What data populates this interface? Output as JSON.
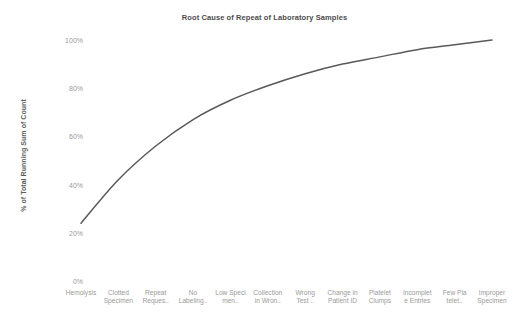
{
  "chart_data": {
    "type": "line",
    "title": "Root Cause of Repeat of Laboratory Samples",
    "xlabel": "",
    "ylabel": "% of Total Running Sum of Count",
    "ylim": [
      0,
      100
    ],
    "grid": false,
    "legend": false,
    "line_color": "#595959",
    "categories": [
      "Hemolysis",
      "Clotted Specimen",
      "Repeat Reques..",
      "No Labeling..",
      "Low Speci men..",
      "Collection in Wron..",
      "Wrong Test ..",
      "Change in Patient ID",
      "Platelet Clumps",
      "Incomplet e Entries",
      "Few Pla telet..",
      "Improper Specimen"
    ],
    "category_lines": [
      [
        "Hemolysis",
        ""
      ],
      [
        "Clotted",
        "Specimen"
      ],
      [
        "Repeat",
        "Reques.."
      ],
      [
        "No",
        "Labeling.."
      ],
      [
        "Low Speci",
        "men.."
      ],
      [
        "Collection",
        "in Wron.."
      ],
      [
        "Wrong",
        "Test .."
      ],
      [
        "Change in",
        "Patient ID"
      ],
      [
        "Platelet",
        "Clumps"
      ],
      [
        "Incomplet",
        "e Entries"
      ],
      [
        "Few Pla",
        "telet.."
      ],
      [
        "Improper",
        "Specimen"
      ]
    ],
    "values": [
      24,
      42,
      56,
      67,
      75,
      81,
      86,
      90,
      93,
      96,
      98,
      100
    ],
    "y_ticks": [
      0,
      20,
      40,
      60,
      80,
      100
    ],
    "y_tick_labels": [
      "0%",
      "20%",
      "40%",
      "60%",
      "80%",
      "100%"
    ]
  }
}
